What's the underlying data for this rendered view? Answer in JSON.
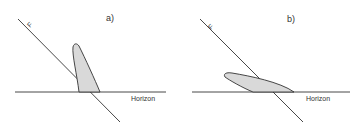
{
  "panels": [
    {
      "id": "a",
      "label": "a)",
      "line_label": "F",
      "horizon_label": "Horizon"
    },
    {
      "id": "b",
      "label": "b)",
      "line_label": "F",
      "horizon_label": "Horizon"
    }
  ],
  "colors": {
    "line": "#333333",
    "fill": "#d9d9d9"
  }
}
